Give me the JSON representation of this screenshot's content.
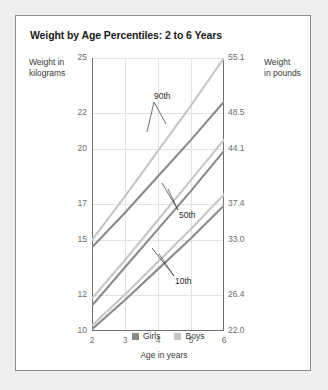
{
  "card": {
    "title": "Weight by Age Percentiles: 2 to 6 Years",
    "background": "#ffffff",
    "border_color": "#8c8c8e"
  },
  "axis_titles": {
    "left_line1": "Weight in",
    "left_line2": "kilograms",
    "right_line1": "Weight",
    "right_line2": "in pounds",
    "x": "Age in years"
  },
  "legend": {
    "items": [
      {
        "label": "Girls",
        "color": "#8a8a8a",
        "swatch_name": "legend-swatch-girls"
      },
      {
        "label": "Boys",
        "color": "#c6c6c6",
        "swatch_name": "legend-swatch-boys"
      }
    ]
  },
  "annotations": {
    "p90": "90th",
    "p50": "50th",
    "p10": "10th"
  },
  "chart_data": {
    "type": "line",
    "title": "Weight by Age Percentiles: 2 to 6 Years",
    "xlabel": "Age in years",
    "ylabel": "Weight in kilograms",
    "ylabel_secondary": "Weight in pounds",
    "grid": true,
    "legend_position": "bottom",
    "x": [
      2,
      3,
      4,
      5,
      6
    ],
    "xlim": [
      2,
      6
    ],
    "xticks": [
      "2",
      "3",
      "4",
      "5",
      "6"
    ],
    "ylim": [
      10,
      25
    ],
    "yticks_kg": [
      "10",
      "12",
      "15",
      "17",
      "20",
      "22",
      "25"
    ],
    "ytick_values_kg": [
      10,
      12,
      15,
      17,
      20,
      22,
      25
    ],
    "yticks_lb": [
      "22.0",
      "26.4",
      "33.0",
      "37.4",
      "44.1",
      "48.5",
      "55.1"
    ],
    "ytick_values_lb": [
      22.0,
      26.4,
      33.0,
      37.4,
      44.1,
      48.5,
      55.1
    ],
    "series": [
      {
        "name": "Girls 90th",
        "percentile": "90th",
        "group": "Girls",
        "color": "#8a8a8a",
        "values": [
          14.6,
          16.5,
          18.5,
          20.5,
          22.6
        ]
      },
      {
        "name": "Boys 90th",
        "percentile": "90th",
        "group": "Boys",
        "color": "#c6c6c6",
        "values": [
          15.0,
          17.4,
          19.9,
          22.4,
          25.0
        ]
      },
      {
        "name": "Girls 50th",
        "percentile": "50th",
        "group": "Girls",
        "color": "#8a8a8a",
        "values": [
          11.4,
          13.5,
          15.6,
          17.7,
          19.9
        ]
      },
      {
        "name": "Boys 50th",
        "percentile": "50th",
        "group": "Boys",
        "color": "#c6c6c6",
        "values": [
          11.8,
          13.9,
          16.1,
          18.3,
          20.5
        ]
      },
      {
        "name": "Girls 10th",
        "percentile": "10th",
        "group": "Girls",
        "color": "#8a8a8a",
        "values": [
          10.1,
          11.7,
          13.4,
          15.1,
          16.9
        ]
      },
      {
        "name": "Boys 10th",
        "percentile": "10th",
        "group": "Boys",
        "color": "#c6c6c6",
        "values": [
          10.3,
          12.0,
          13.8,
          15.6,
          17.5
        ]
      }
    ]
  }
}
